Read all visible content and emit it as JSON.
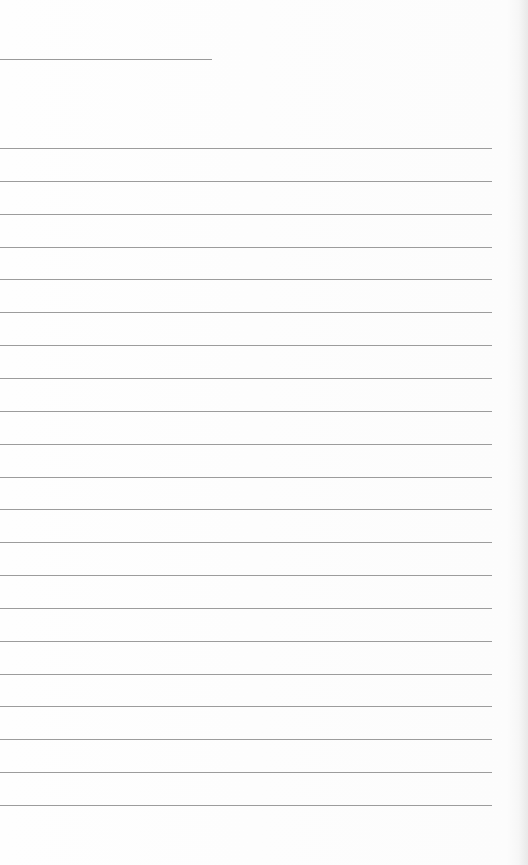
{
  "page": {
    "type": "lined-paper",
    "background_color": "#fdfdfd",
    "line_color": "#9c9c9c",
    "header_line": {
      "y": 59,
      "x_start": 0,
      "x_end": 212
    },
    "ruled_lines": {
      "count": 21,
      "first_y": 148,
      "spacing": 32.85,
      "x_start": 0,
      "x_end": 492
    }
  }
}
